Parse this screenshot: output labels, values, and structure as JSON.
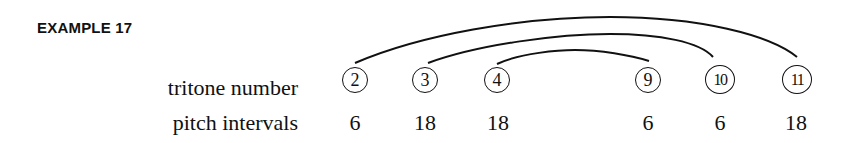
{
  "title": "EXAMPLE 17",
  "rows": {
    "tritone_label": "tritone number",
    "pitch_label": "pitch intervals"
  },
  "columns": [
    {
      "tritone": "2",
      "interval": "6"
    },
    {
      "tritone": "3",
      "interval": "18"
    },
    {
      "tritone": "4",
      "interval": "18"
    },
    {
      "tritone": "9",
      "interval": "6"
    },
    {
      "tritone": "10",
      "interval": "6"
    },
    {
      "tritone": "11",
      "interval": "18"
    }
  ],
  "arcs": [
    {
      "from": "2",
      "to": "11"
    },
    {
      "from": "3",
      "to": "10"
    },
    {
      "from": "4",
      "to": "9"
    }
  ]
}
